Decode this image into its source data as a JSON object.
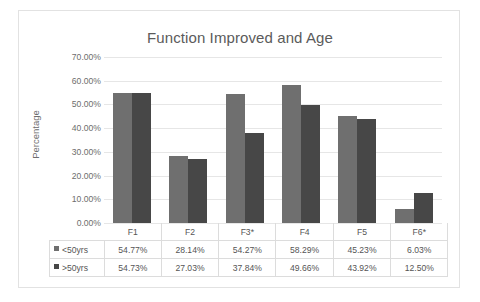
{
  "chart_data": {
    "type": "bar",
    "title": "Function Improved and Age",
    "xlabel": "",
    "ylabel": "Percentage",
    "categories": [
      "F1",
      "F2",
      "F3*",
      "F4",
      "F5",
      "F6*"
    ],
    "series": [
      {
        "name": "<50yrs",
        "color": "#6f6f6f",
        "values": [
          54.77,
          28.14,
          54.27,
          58.29,
          45.23,
          6.03
        ],
        "labels": [
          "54.77%",
          "28.14%",
          "54.27%",
          "58.29%",
          "45.23%",
          "6.03%"
        ]
      },
      {
        "name": ">50yrs",
        "color": "#474747",
        "values": [
          54.73,
          27.03,
          37.84,
          49.66,
          43.92,
          12.5
        ],
        "labels": [
          "54.73%",
          "27.03%",
          "37.84%",
          "49.66%",
          "43.92%",
          "12.50%"
        ]
      }
    ],
    "ylim": [
      0,
      70
    ],
    "ytick_labels": [
      "70.00%",
      "60.00%",
      "50.00%",
      "40.00%",
      "30.00%",
      "20.00%",
      "10.00%",
      "0.00%"
    ],
    "ytick_values": [
      70,
      60,
      50,
      40,
      30,
      20,
      10,
      0
    ],
    "grid": true,
    "legend_position": "data-table",
    "has_data_table": true
  },
  "colors": {
    "series_1": "#6f6f6f",
    "series_2": "#474747",
    "gridline": "#e6e6e6",
    "text": "#6d6d6d",
    "title": "#5b5b5b",
    "table_border": "#dcdcdc",
    "frame_border": "#e2e2e2"
  },
  "icons": {
    "legend_marker": "legend-swatch-icon"
  }
}
